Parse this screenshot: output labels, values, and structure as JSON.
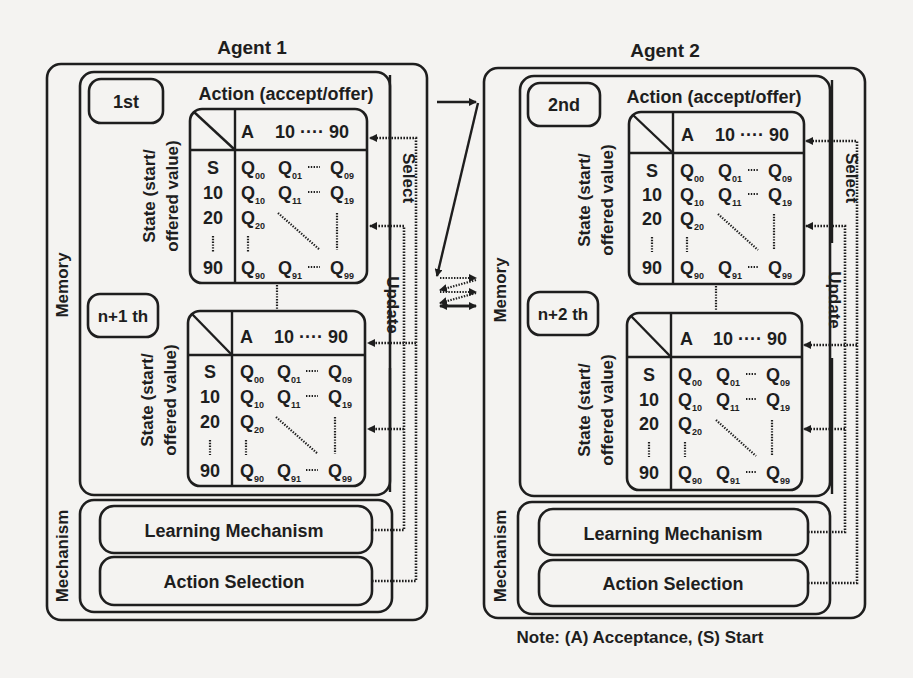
{
  "agents": [
    {
      "title": "Agent 1",
      "memory_label": "Memory",
      "mechanism_label": "Mechanism",
      "action_label": "Action (accept/offer)",
      "state_label_line1": "State (start/",
      "state_label_line2": "offered value)",
      "select_label": "Select",
      "update_label": "Update",
      "tables": [
        {
          "order_label": "1st",
          "header": {
            "a": "A",
            "range": "10 ···· 90"
          },
          "states": [
            "S",
            "10",
            "20",
            "⋮",
            "90"
          ],
          "q_rows": [
            [
              "Q00",
              "Q01",
              "····",
              "Q09"
            ],
            [
              "Q10",
              "Q11",
              "····",
              "Q19"
            ],
            [
              "Q20"
            ],
            [
              "⋮"
            ],
            [
              "Q90",
              "Q91",
              "····",
              "Q99"
            ]
          ]
        },
        {
          "order_label": "n+1 th",
          "header": {
            "a": "A",
            "range": "10 ···· 90"
          },
          "states": [
            "S",
            "10",
            "20",
            "⋮",
            "90"
          ],
          "q_rows": [
            [
              "Q00",
              "Q01",
              "····",
              "Q09"
            ],
            [
              "Q10",
              "Q11",
              "····",
              "Q19"
            ],
            [
              "Q20"
            ],
            [
              "⋮"
            ],
            [
              "Q90",
              "Q91",
              "····",
              "Q99"
            ]
          ]
        }
      ],
      "mechanisms": [
        "Learning Mechanism",
        "Action Selection"
      ]
    },
    {
      "title": "Agent 2",
      "memory_label": "Memory",
      "mechanism_label": "Mechanism",
      "action_label": "Action (accept/offer)",
      "state_label_line1": "State (start/",
      "state_label_line2": "offered value)",
      "select_label": "Select",
      "update_label": "Update",
      "tables": [
        {
          "order_label": "2nd",
          "header": {
            "a": "A",
            "range": "10 ···· 90"
          },
          "states": [
            "S",
            "10",
            "20",
            "⋮",
            "90"
          ],
          "q_rows": [
            [
              "Q00",
              "Q01",
              "····",
              "Q09"
            ],
            [
              "Q10",
              "Q11",
              "····",
              "Q19"
            ],
            [
              "Q20"
            ],
            [
              "⋮"
            ],
            [
              "Q90",
              "Q91",
              "····",
              "Q99"
            ]
          ]
        },
        {
          "order_label": "n+2 th",
          "header": {
            "a": "A",
            "range": "10 ···· 90"
          },
          "states": [
            "S",
            "10",
            "20",
            "⋮",
            "90"
          ],
          "q_rows": [
            [
              "Q00",
              "Q01",
              "····",
              "Q09"
            ],
            [
              "Q10",
              "Q11",
              "····",
              "Q19"
            ],
            [
              "Q20"
            ],
            [
              "⋮"
            ],
            [
              "Q90",
              "Q91",
              "····",
              "Q99"
            ]
          ]
        }
      ],
      "mechanisms": [
        "Learning Mechanism",
        "Action Selection"
      ]
    }
  ],
  "note": "Note: (A) Acceptance, (S) Start",
  "colors": {
    "ink": "#1e1e1e",
    "paper": "#f4f3f1"
  }
}
